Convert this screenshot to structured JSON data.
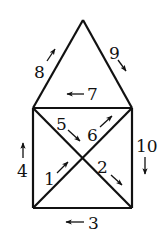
{
  "diagram": {
    "type": "house-graph-with-numbered-directed-edges",
    "colors": {
      "line": "#111111",
      "background": "#ffffff"
    },
    "nodes": {
      "apex": [
        83,
        20
      ],
      "top_left": [
        33,
        108
      ],
      "top_right": [
        132,
        108
      ],
      "bottom_left": [
        33,
        208
      ],
      "bottom_right": [
        132,
        208
      ]
    },
    "edges": [
      {
        "label": "1",
        "from": "bottom_left",
        "to": "center",
        "direction": "up-right"
      },
      {
        "label": "2",
        "from": "center",
        "to": "bottom_right",
        "direction": "down-right"
      },
      {
        "label": "3",
        "from": "bottom_right",
        "to": "bottom_left",
        "direction": "left"
      },
      {
        "label": "4",
        "from": "bottom_left",
        "to": "top_left",
        "direction": "up"
      },
      {
        "label": "5",
        "from": "top_left",
        "to": "center",
        "direction": "down-right"
      },
      {
        "label": "6",
        "from": "center",
        "to": "top_right",
        "direction": "up-right"
      },
      {
        "label": "7",
        "from": "top_right",
        "to": "top_left",
        "direction": "left"
      },
      {
        "label": "8",
        "from": "top_left",
        "to": "apex",
        "direction": "up-right"
      },
      {
        "label": "9",
        "from": "apex",
        "to": "top_right",
        "direction": "down-right"
      },
      {
        "label": "10",
        "from": "top_right",
        "to": "bottom_right",
        "direction": "down"
      }
    ],
    "labels": {
      "e1": "1",
      "e2": "2",
      "e3": "3",
      "e4": "4",
      "e5": "5",
      "e6": "6",
      "e7": "7",
      "e8": "8",
      "e9": "9",
      "e10": "10"
    }
  }
}
